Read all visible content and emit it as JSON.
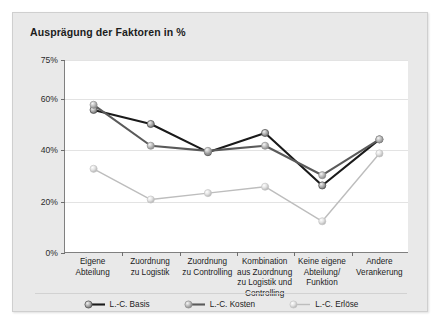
{
  "chart_data": {
    "type": "line",
    "title": "Ausprägung der Faktoren in %",
    "xlabel": "",
    "ylabel": "",
    "grid": true,
    "legend_position": "bottom",
    "ylim": [
      0,
      75
    ],
    "yticks": [
      0,
      20,
      40,
      60,
      75
    ],
    "ytick_labels": [
      "0%",
      "20%",
      "40%",
      "60%",
      "75%"
    ],
    "categories": [
      "Eigene Abteilung",
      "Zuordnung zu Logistik",
      "Zuordnung zu Controlling",
      "Kombination aus Zuordnung zu Logistik und Controlling",
      "Keine eigene Abteilung/ Funktion",
      "Andere Verankerung"
    ],
    "category_lines": [
      [
        "Eigene",
        "Abteilung"
      ],
      [
        "Zuordnung",
        "zu Logistik"
      ],
      [
        "Zuordnung",
        "zu Controlling"
      ],
      [
        "Kombination",
        "aus Zuordnung",
        "zu Logistik und",
        "Controlling"
      ],
      [
        "Keine eigene",
        "Abteilung/",
        "Funktion"
      ],
      [
        "Andere",
        "Verankerung"
      ]
    ],
    "series": [
      {
        "name": "L.-C. Basis",
        "color": "#1a1a1a",
        "values": [
          55.5,
          50.0,
          39.0,
          46.5,
          26.0,
          44.0
        ]
      },
      {
        "name": "L.-C. Kosten",
        "color": "#5a5a5a",
        "values": [
          57.5,
          41.5,
          39.5,
          41.5,
          30.0,
          44.0
        ]
      },
      {
        "name": "L.-C. Erlöse",
        "color": "#bdbdbd",
        "values": [
          32.5,
          20.5,
          23.0,
          25.5,
          12.0,
          38.5
        ]
      }
    ]
  },
  "legend": {
    "items": [
      {
        "label": "L.-C. Basis"
      },
      {
        "label": "L.-C. Kosten"
      },
      {
        "label": "L.-C. Erlöse"
      }
    ]
  },
  "colors": {
    "figure_background": "#e9e9e9",
    "plot_background": "#ffffff",
    "axis": "#808080",
    "gridline": "#e3e3e3",
    "series_basis": "#1a1a1a",
    "series_kosten": "#5a5a5a",
    "series_erloese": "#bdbdbd"
  }
}
